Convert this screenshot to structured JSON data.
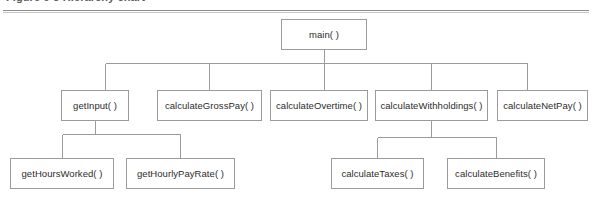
{
  "caption": {
    "text": "Figure 6-3  Hierarchy chart"
  },
  "diagram": {
    "type": "hierarchy-chart",
    "title": "Hierarchy chart",
    "border_color": "#9b9b9b",
    "line_color": "#9b9b9b",
    "background": "#ffffff",
    "text_color": "#2c2c2c",
    "levels": 3,
    "nodes": [
      {
        "id": "main",
        "label": "main( )",
        "level": 0,
        "x": 281,
        "y": 19,
        "w": 86,
        "h": 31
      },
      {
        "id": "getInput",
        "label": "getInput( )",
        "level": 1,
        "x": 61,
        "y": 90,
        "w": 68,
        "h": 31
      },
      {
        "id": "calculateGrossPay",
        "label": "calculateGrossPay( )",
        "level": 1,
        "x": 157,
        "y": 90,
        "w": 105,
        "h": 31
      },
      {
        "id": "calculateOvertime",
        "label": "calculateOvertime( )",
        "level": 1,
        "x": 270,
        "y": 90,
        "w": 98,
        "h": 31
      },
      {
        "id": "calculateWithholdings",
        "label": "calculateWithholdings( )",
        "level": 1,
        "x": 375,
        "y": 90,
        "w": 113,
        "h": 31
      },
      {
        "id": "calculateNetPay",
        "label": "calculateNetPay( )",
        "level": 1,
        "x": 497,
        "y": 90,
        "w": 91,
        "h": 31
      },
      {
        "id": "getHoursWorked",
        "label": "getHoursWorked( )",
        "level": 2,
        "x": 10,
        "y": 158,
        "w": 104,
        "h": 31
      },
      {
        "id": "getHourlyPayRate",
        "label": "getHourlyPayRate( )",
        "level": 2,
        "x": 126,
        "y": 158,
        "w": 109,
        "h": 31
      },
      {
        "id": "calculateTaxes",
        "label": "calculateTaxes( )",
        "level": 2,
        "x": 331,
        "y": 158,
        "w": 93,
        "h": 31
      },
      {
        "id": "calculateBenefits",
        "label": "calculateBenefits( )",
        "level": 2,
        "x": 447,
        "y": 158,
        "w": 98,
        "h": 31
      }
    ],
    "edges": [
      {
        "from": "main",
        "to": "getInput"
      },
      {
        "from": "main",
        "to": "calculateGrossPay"
      },
      {
        "from": "main",
        "to": "calculateOvertime"
      },
      {
        "from": "main",
        "to": "calculateWithholdings"
      },
      {
        "from": "main",
        "to": "calculateNetPay"
      },
      {
        "from": "getInput",
        "to": "getHoursWorked"
      },
      {
        "from": "getInput",
        "to": "getHourlyPayRate"
      },
      {
        "from": "calculateWithholdings",
        "to": "calculateTaxes"
      },
      {
        "from": "calculateWithholdings",
        "to": "calculateBenefits"
      }
    ]
  }
}
